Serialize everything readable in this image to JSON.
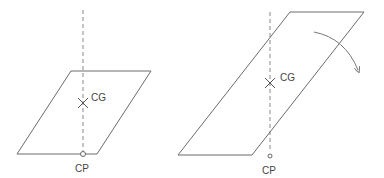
{
  "figures": [
    {
      "id": "stable",
      "cg_label": "CG",
      "cp_label": "CP"
    },
    {
      "id": "tilted",
      "cg_label": "CG",
      "cp_label": "CP",
      "arrow": "rotation-clockwise"
    }
  ],
  "colors": {
    "stroke": "#6b6b6b",
    "dash": "#888888",
    "text": "#444444"
  }
}
